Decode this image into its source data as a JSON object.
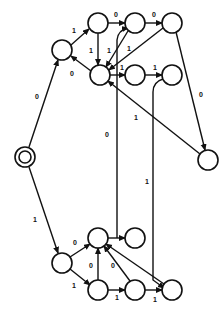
{
  "diagram": {
    "type": "state-transition-diagram",
    "node_radius": 10,
    "colors": {
      "stroke": "#111111",
      "background": "#ffffff"
    },
    "nodes": [
      {
        "id": "S",
        "x": 25,
        "y": 157,
        "start": true
      },
      {
        "id": "A",
        "x": 62,
        "y": 50
      },
      {
        "id": "T1",
        "x": 98,
        "y": 23
      },
      {
        "id": "T2",
        "x": 135,
        "y": 23
      },
      {
        "id": "T3",
        "x": 172,
        "y": 23
      },
      {
        "id": "M",
        "x": 100,
        "y": 75
      },
      {
        "id": "M2",
        "x": 135,
        "y": 75
      },
      {
        "id": "M3",
        "x": 172,
        "y": 75
      },
      {
        "id": "R",
        "x": 208,
        "y": 160
      },
      {
        "id": "B1",
        "x": 62,
        "y": 263
      },
      {
        "id": "B2",
        "x": 98,
        "y": 238
      },
      {
        "id": "B3",
        "x": 135,
        "y": 238
      },
      {
        "id": "B4",
        "x": 98,
        "y": 290
      },
      {
        "id": "B5",
        "x": 135,
        "y": 290
      },
      {
        "id": "B6",
        "x": 172,
        "y": 290
      }
    ],
    "edges": [
      {
        "from": "S",
        "to": "A",
        "label": "0",
        "path": "M29 147 L58 60",
        "lx": 35,
        "ly": 99
      },
      {
        "from": "S",
        "to": "B1",
        "label": "1",
        "path": "M29 167 L58 253",
        "lx": 33,
        "ly": 222
      },
      {
        "from": "A",
        "to": "T1",
        "label": "1",
        "path": "M71 45 L89 29",
        "lx": 72,
        "ly": 33
      },
      {
        "from": "M",
        "to": "A",
        "label": "0",
        "path": "M91 71 L71 56",
        "lx": 70,
        "ly": 76
      },
      {
        "from": "T1",
        "to": "M",
        "label": "1",
        "path": "M98 33 L98 65",
        "lx": 89,
        "ly": 53
      },
      {
        "from": "T1",
        "to": "T2",
        "label": "0",
        "path": "M108 23 L125 23",
        "lx": 114,
        "ly": 17
      },
      {
        "from": "T2",
        "to": "T3",
        "label": "0",
        "path": "M145 23 L162 23",
        "lx": 152,
        "ly": 17
      },
      {
        "from": "T2",
        "to": "M",
        "label": "1",
        "path": "M128 31 L106 67",
        "lx": 107,
        "ly": 53
      },
      {
        "from": "T3",
        "to": "M",
        "label": "1",
        "path": "M163 28 L109 70",
        "lx": 127,
        "ly": 51
      },
      {
        "from": "T3",
        "to": "R",
        "label": "0",
        "path": "M176 32 L205 150",
        "lx": 199,
        "ly": 97
      },
      {
        "from": "M",
        "to": "M2",
        "label": "1",
        "path": "M110 75 L125 75",
        "lx": 120,
        "ly": 70
      },
      {
        "from": "M2",
        "to": "M3",
        "label": "1",
        "path": "M145 75 L162 75",
        "lx": 153,
        "ly": 70
      },
      {
        "from": "R",
        "to": "M",
        "label": "1",
        "path": "M200 154 L108 81",
        "lx": 134,
        "ly": 120
      },
      {
        "from": "B3",
        "to": "T2",
        "label": "0",
        "path": "M117 238 L117 40 Q118 30 128 28",
        "lx": 105,
        "ly": 137
      },
      {
        "from": "M3",
        "to": "B6",
        "label": "1",
        "path": "M163 79 Q153 82 153 92 L153 280 L164 288",
        "lx": 145,
        "ly": 184
      },
      {
        "from": "B1",
        "to": "B2",
        "label": "0",
        "path": "M70 257 L90 244",
        "lx": 73,
        "ly": 245
      },
      {
        "from": "B1",
        "to": "B4",
        "label": "1",
        "path": "M70 269 L90 285",
        "lx": 72,
        "ly": 288
      },
      {
        "from": "B2",
        "to": "B3",
        "label": "",
        "path": "M108 238 L125 238",
        "lx": 0,
        "ly": 0
      },
      {
        "from": "B4",
        "to": "B2",
        "label": "0",
        "path": "M98 280 L98 248",
        "lx": 89,
        "ly": 268
      },
      {
        "from": "B5",
        "to": "B2",
        "label": "0",
        "path": "M130 281 L104 246",
        "lx": 111,
        "ly": 268
      },
      {
        "from": "B6",
        "to": "B2",
        "label": "",
        "path": "M164 284 L106 244",
        "lx": 0,
        "ly": 0
      },
      {
        "from": "B4",
        "to": "B5",
        "label": "1",
        "path": "M108 290 L125 290",
        "lx": 115,
        "ly": 300
      },
      {
        "from": "B5",
        "to": "B6",
        "label": "1",
        "path": "M145 290 L162 290",
        "lx": 153,
        "ly": 302
      }
    ]
  }
}
